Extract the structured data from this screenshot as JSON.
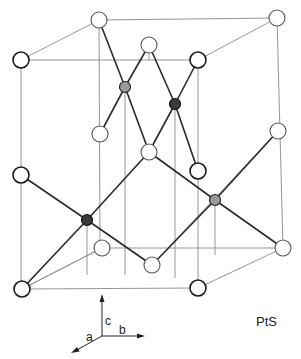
{
  "diagram": {
    "compound_label": "PtS",
    "axes": {
      "a": "a",
      "b": "b",
      "c": "c"
    },
    "legend": {
      "sulfur_atom": "open sphere",
      "platinum_atom": "filled sphere"
    }
  },
  "colors": {
    "background": "#ffffff",
    "line": "#2a2a2a",
    "thin_line": "#8a8a8a",
    "pt_dark": "#3a3a3a",
    "pt_light": "#9a9a9a"
  }
}
